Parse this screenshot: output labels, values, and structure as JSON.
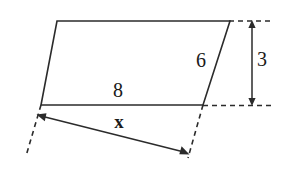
{
  "figure": {
    "type": "geometry-diagram",
    "background_color": "#ffffff",
    "stroke_color": "#2b2b2b",
    "labels": {
      "side_right": "6",
      "base_top": "8",
      "height": "3",
      "unknown": "x"
    },
    "geometry": {
      "parallelogram": {
        "top_left": [
          57,
          21
        ],
        "top_right": [
          230,
          21
        ],
        "bottom_right": [
          203,
          105
        ],
        "bottom_left": [
          41,
          105
        ]
      },
      "dashed_extension_left": [
        [
          41,
          105
        ],
        [
          26,
          155
        ]
      ],
      "dashed_extension_right": [
        [
          203,
          105
        ],
        [
          188,
          157
        ]
      ],
      "dashed_guide_top": [
        [
          230,
          21
        ],
        [
          270,
          21
        ]
      ],
      "dashed_guide_bottom": [
        [
          203,
          105
        ],
        [
          270,
          105
        ]
      ],
      "height_dimension_line": [
        [
          252,
          21
        ],
        [
          252,
          105
        ]
      ],
      "x_dimension_line": [
        [
          38,
          116
        ],
        [
          187,
          153
        ]
      ]
    }
  }
}
